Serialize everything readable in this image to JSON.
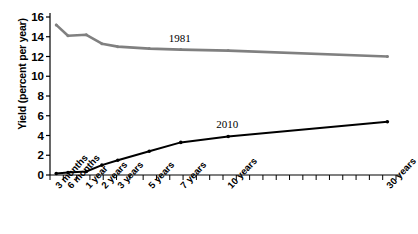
{
  "chart_data": {
    "type": "line",
    "title": "",
    "xlabel": "",
    "ylabel": "Yield (percent per year)",
    "ylim": [
      0,
      16
    ],
    "yticks": [
      0,
      2,
      4,
      6,
      8,
      10,
      12,
      14,
      16
    ],
    "grid": false,
    "legend_position": "inline-labels",
    "categories": [
      "3 months",
      "6 months",
      "1 year",
      "2 years",
      "3 years",
      "5 years",
      "7 years",
      "10 years",
      "30 years"
    ],
    "x_tick_labels": [
      "3 months",
      "6 months",
      "1 year",
      "2 years",
      "3 years",
      "5 years",
      "7 years",
      "10 years",
      "30 years"
    ],
    "series": [
      {
        "name": "1981",
        "color": "#808080",
        "x": [
          "3 months",
          "6 months",
          "1 year",
          "2 years",
          "3 years",
          "5 years",
          "7 years",
          "10 years",
          "30 years"
        ],
        "values": [
          15.2,
          14.1,
          14.2,
          13.3,
          13.0,
          12.8,
          12.7,
          12.6,
          12.0
        ]
      },
      {
        "name": "2010",
        "color": "#000000",
        "x": [
          "3 months",
          "6 months",
          "1 year",
          "2 years",
          "3 years",
          "5 years",
          "7 years",
          "10 years",
          "30 years"
        ],
        "values": [
          0.15,
          0.25,
          0.35,
          1.0,
          1.5,
          2.4,
          3.3,
          3.9,
          5.4
        ]
      }
    ],
    "annotations": [
      {
        "text": "1981",
        "series": "1981"
      },
      {
        "text": "2010",
        "series": "2010"
      }
    ]
  },
  "caption": ""
}
